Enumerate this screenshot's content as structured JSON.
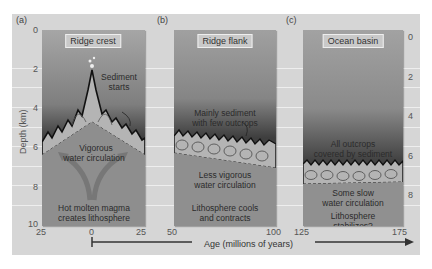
{
  "figure": {
    "y_axis": {
      "label": "Depth (km)",
      "ticks": [
        "0",
        "2",
        "4",
        "6",
        "8",
        "10"
      ]
    },
    "x_axis": {
      "label": "Age (millions of years)",
      "ticks_a": [
        "25",
        "0",
        "25"
      ],
      "ticks_b": [
        "50",
        "100"
      ],
      "ticks_c": [
        "125",
        "175"
      ]
    },
    "panels": [
      {
        "letter": "(a)",
        "title": "Ridge crest",
        "labels": [
          "Sediment",
          "starts",
          "Vigorous",
          "water circulation",
          "Hot molten magma",
          "creates lithosphere"
        ]
      },
      {
        "letter": "(b)",
        "title": "Ridge flank",
        "labels": [
          "Mainly sediment",
          "with few outcrops",
          "Less vigorous",
          "water circulation",
          "Lithosphere cools",
          "and contracts"
        ]
      },
      {
        "letter": "(c)",
        "title": "Ocean basin",
        "labels": [
          "All outcrops",
          "covered by sediment",
          "Some slow",
          "water circulation",
          "Lithosphere",
          "stabilizes?"
        ]
      }
    ],
    "colors": {
      "background": "#d6d6d6",
      "panel_top": "#9a9a9a",
      "panel_dark": "#3a3a3a",
      "crust": "#b5b5b5",
      "lithosphere": "#8f8f8f"
    }
  }
}
